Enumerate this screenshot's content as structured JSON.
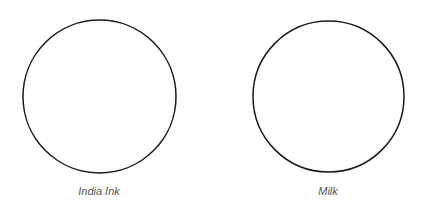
{
  "diagram": {
    "circles": [
      {
        "label": "India Ink",
        "stroke": "#1a1a1a",
        "fill": "#ffffff"
      },
      {
        "label": "Milk",
        "stroke": "#1a1a1a",
        "fill": "#ffffff"
      }
    ]
  }
}
